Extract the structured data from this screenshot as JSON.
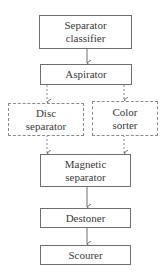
{
  "diagram": {
    "type": "flowchart",
    "direction": "top-to-bottom",
    "nodes": [
      {
        "id": "separator_classifier",
        "lines": [
          "Separator",
          "classifier"
        ],
        "style": "solid"
      },
      {
        "id": "aspirator",
        "lines": [
          "Aspirator"
        ],
        "style": "solid"
      },
      {
        "id": "disc_separator",
        "lines": [
          "Disc",
          "separator"
        ],
        "style": "dashed"
      },
      {
        "id": "color_sorter",
        "lines": [
          "Color",
          "sorter"
        ],
        "style": "dashed"
      },
      {
        "id": "magnetic_separator",
        "lines": [
          "Magnetic",
          "separator"
        ],
        "style": "solid"
      },
      {
        "id": "destoner",
        "lines": [
          "Destoner"
        ],
        "style": "solid"
      },
      {
        "id": "scourer",
        "lines": [
          "Scourer"
        ],
        "style": "solid"
      }
    ],
    "edges": [
      {
        "from": "separator_classifier",
        "to": "aspirator",
        "style": "solid"
      },
      {
        "from": "aspirator",
        "to": "disc_separator",
        "style": "dashed"
      },
      {
        "from": "aspirator",
        "to": "color_sorter",
        "style": "dashed"
      },
      {
        "from": "disc_separator",
        "to": "magnetic_separator",
        "style": "dashed"
      },
      {
        "from": "color_sorter",
        "to": "magnetic_separator",
        "style": "dashed"
      },
      {
        "from": "magnetic_separator",
        "to": "destoner",
        "style": "solid"
      },
      {
        "from": "destoner",
        "to": "scourer",
        "style": "solid"
      }
    ],
    "colors": {
      "border": "#6f6f6f",
      "dashed_border": "#8a8a8a",
      "text": "#3a3a3a",
      "background": "#ffffff"
    }
  }
}
